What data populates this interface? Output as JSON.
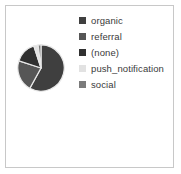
{
  "figure": {
    "background": "#ffffff",
    "border_color": "#c8c8c8"
  },
  "legend": {
    "position": "right",
    "items": [
      {
        "label": "organic",
        "color": "#3f3f3f"
      },
      {
        "label": "referral",
        "color": "#565656"
      },
      {
        "label": "(none)",
        "color": "#303030"
      },
      {
        "label": "push_notification",
        "color": "#e2e2e2"
      },
      {
        "label": "social",
        "color": "#7b7b7b"
      }
    ]
  },
  "chart_data": {
    "type": "pie",
    "title": "",
    "xlabel": "",
    "ylabel": "",
    "legend_position": "right",
    "grid": false,
    "categories": [
      "organic",
      "referral",
      "(none)",
      "push_notification",
      "social"
    ],
    "values": [
      58,
      22,
      15,
      3,
      2
    ],
    "colors": [
      "#3f3f3f",
      "#565656",
      "#303030",
      "#e2e2e2",
      "#7b7b7b"
    ],
    "start_angle": -90,
    "wedge_edge_color": "#e8e8e8",
    "wedge_edge_width": 1.2,
    "center": [
      35,
      66
    ],
    "radius": 23
  }
}
